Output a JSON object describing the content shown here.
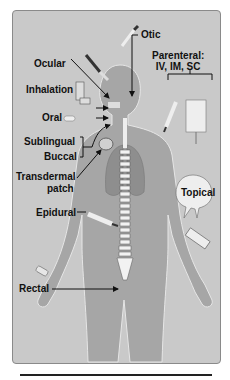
{
  "figure": {
    "labels": {
      "ocular": "Ocular",
      "otic": "Otic",
      "inhalation": "Inhalation",
      "oral": "Oral",
      "parenteral_line1": "Parenteral:",
      "parenteral_line2": "IV, IM, SC",
      "sublingual": "Sublingual",
      "buccal": "Buccal",
      "transdermal_line1": "Transdermal",
      "transdermal_line2": "patch",
      "topical": "Topical",
      "epidural": "Epidural",
      "rectal": "Rectal"
    },
    "colors": {
      "panel_bg": "#c9c9c9",
      "body": "#a8a8a8",
      "text": "#111111"
    }
  }
}
